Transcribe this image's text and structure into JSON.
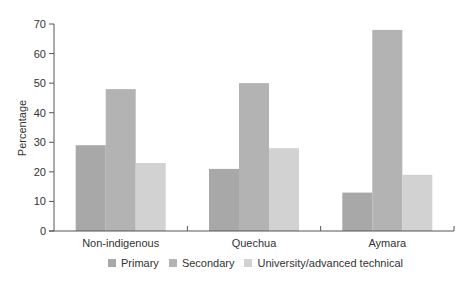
{
  "chart_data": {
    "type": "bar",
    "title": "",
    "xlabel": "",
    "ylabel": "Percentage",
    "ylim": [
      0,
      70
    ],
    "yticks": [
      0,
      10,
      20,
      30,
      40,
      50,
      60,
      70
    ],
    "grid": false,
    "legend_position": "bottom",
    "categories": [
      "Non-indigenous",
      "Quechua",
      "Aymara"
    ],
    "series": [
      {
        "name": "Primary",
        "color": "#a8a8a8",
        "values": [
          29,
          21,
          13
        ]
      },
      {
        "name": "Secondary",
        "color": "#b3b3b3",
        "values": [
          48,
          50,
          68
        ]
      },
      {
        "name": "University/advanced technical",
        "color": "#d2d2d2",
        "values": [
          23,
          28,
          19
        ]
      }
    ]
  },
  "colors": {
    "axis": "#555555",
    "text": "#333333"
  }
}
